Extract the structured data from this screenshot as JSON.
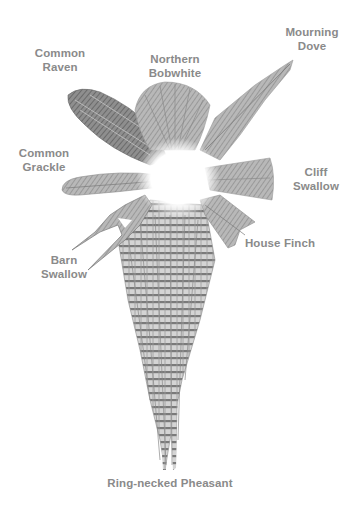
{
  "figure": {
    "colors": {
      "label": "#8a8a8a",
      "feather_dark": "#6a6a6a",
      "feather_mid": "#9a9a9a",
      "feather_light": "#c8c8c8",
      "background": "#ffffff"
    }
  },
  "labels": {
    "common_raven": {
      "line1": "Common",
      "line2": "Raven"
    },
    "northern_bobwhite": {
      "line1": "Northern",
      "line2": "Bobwhite"
    },
    "mourning_dove": {
      "line1": "Mourning",
      "line2": "Dove"
    },
    "common_grackle": {
      "line1": "Common",
      "line2": "Grackle"
    },
    "cliff_swallow": {
      "line1": "Cliff",
      "line2": "Swallow"
    },
    "barn_swallow": {
      "line1": "Barn",
      "line2": "Swallow"
    },
    "house_finch": {
      "line1": "House Finch"
    },
    "ring_necked_pheasant": {
      "line1": "Ring-necked Pheasant"
    }
  }
}
